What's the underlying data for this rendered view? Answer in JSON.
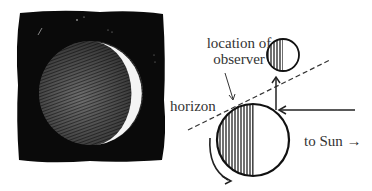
{
  "diagram": {
    "labels": {
      "observer_line1": "location of",
      "observer_line2": "observer",
      "horizon": "horizon",
      "to_sun": "to Sun",
      "to_sun_arrow": "→"
    },
    "colors": {
      "ink": "#222222",
      "paper": "#ffffff",
      "sky": "#0a0a0a"
    },
    "left_panel": {
      "description": "crescent moon with earthshine on black sky"
    },
    "right_panel": {
      "earth": {
        "cx": 253,
        "cy": 140,
        "r": 36
      },
      "moon": {
        "cx": 283,
        "cy": 55,
        "r": 16
      }
    }
  }
}
